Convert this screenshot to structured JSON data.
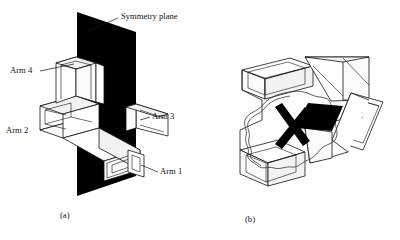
{
  "figure": {
    "title_caption_a": "(a)",
    "title_caption_b": "(b)",
    "panels": [
      {
        "id": "panel-a",
        "caption": "(a)",
        "description": "Cruciform tubular specimen with symmetry plane",
        "labels": [
          {
            "name": "symmetry-plane",
            "text": "Symmetry plane",
            "x": 121,
            "y": 17
          },
          {
            "name": "arm-4",
            "text": "Arm 4",
            "x": 10,
            "y": 71
          },
          {
            "name": "arm-2",
            "text": "Arm 2",
            "x": 6,
            "y": 131
          },
          {
            "name": "arm-3",
            "text": "Arm 3",
            "x": 152,
            "y": 117
          },
          {
            "name": "arm-1",
            "text": "Arm 1",
            "x": 160,
            "y": 172
          }
        ],
        "colors": {
          "plane": "#000000",
          "outline": "#111111",
          "face": "#ffffff"
        }
      },
      {
        "id": "panel-b",
        "caption": "(b)",
        "description": "Cruciform specimen viewed along arm axis showing fracture surface and crack",
        "labels": [],
        "colors": {
          "mark": "#000000",
          "outline": "#111111",
          "face": "#ffffff"
        }
      }
    ]
  },
  "captions": {
    "a": "(a)",
    "b": "(b)"
  },
  "labels": {
    "symmetry_plane": "Symmetry plane",
    "arm1": "Arm 1",
    "arm2": "Arm 2",
    "arm3": "Arm 3",
    "arm4": "Arm 4"
  },
  "colors": {
    "plane_fill": "#000000",
    "outline": "#111111",
    "tube_face": "#ffffff",
    "tube_shade": "#f2f2f2",
    "background": "#ffffff"
  }
}
